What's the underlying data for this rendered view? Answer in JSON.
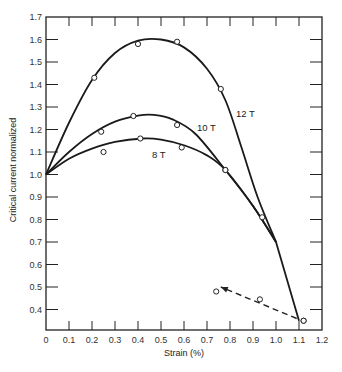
{
  "chart_data": {
    "type": "line",
    "title": "",
    "xlabel": "Strain (%)",
    "ylabel": "Critical current normalized",
    "xlim": [
      0,
      1.2
    ],
    "ylim": [
      0.31,
      1.7
    ],
    "x_ticks": [
      "0",
      "0.1",
      "0.2",
      "0.3",
      "0.4",
      "0.5",
      "0.6",
      "0.7",
      "0.8",
      "0.9",
      "1.0",
      "1.1",
      "1.2"
    ],
    "y_ticks": [
      "0.4",
      "0.5",
      "0.6",
      "0.7",
      "0.8",
      "0.9",
      "1.0",
      "1.1",
      "1.2",
      "1.3",
      "1.4",
      "1.5",
      "1.6",
      "1.7"
    ],
    "grid": false,
    "legend": "inline curve labels",
    "series": [
      {
        "name": "12 T",
        "points": [
          [
            0,
            1.0
          ],
          [
            0.21,
            1.43
          ],
          [
            0.4,
            1.58
          ],
          [
            0.57,
            1.59
          ],
          [
            0.76,
            1.38
          ],
          [
            0.94,
            0.81
          ],
          [
            1.12,
            0.35
          ]
        ],
        "curve": [
          [
            0,
            1.0
          ],
          [
            0.1,
            1.23
          ],
          [
            0.2,
            1.42
          ],
          [
            0.3,
            1.54
          ],
          [
            0.4,
            1.595
          ],
          [
            0.5,
            1.6
          ],
          [
            0.6,
            1.565
          ],
          [
            0.7,
            1.47
          ],
          [
            0.78,
            1.33
          ],
          [
            0.85,
            1.12
          ],
          [
            0.92,
            0.9
          ],
          [
            1.0,
            0.7
          ],
          [
            1.1,
            0.35
          ]
        ]
      },
      {
        "name": "10 T",
        "points": [
          [
            0,
            1.0
          ],
          [
            0.24,
            1.19
          ],
          [
            0.38,
            1.26
          ],
          [
            0.57,
            1.22
          ],
          [
            0.78,
            1.02
          ]
        ],
        "curve": [
          [
            0,
            1.0
          ],
          [
            0.1,
            1.1
          ],
          [
            0.2,
            1.18
          ],
          [
            0.3,
            1.235
          ],
          [
            0.4,
            1.262
          ],
          [
            0.47,
            1.265
          ],
          [
            0.55,
            1.245
          ],
          [
            0.65,
            1.18
          ],
          [
            0.78,
            1.02
          ],
          [
            0.9,
            0.86
          ],
          [
            1.0,
            0.7
          ]
        ]
      },
      {
        "name": "8 T",
        "points": [
          [
            0,
            1.0
          ],
          [
            0.25,
            1.1
          ],
          [
            0.41,
            1.16
          ],
          [
            0.59,
            1.12
          ],
          [
            0.78,
            1.02
          ]
        ],
        "curve": [
          [
            0,
            1.0
          ],
          [
            0.1,
            1.07
          ],
          [
            0.2,
            1.115
          ],
          [
            0.3,
            1.145
          ],
          [
            0.42,
            1.16
          ],
          [
            0.5,
            1.155
          ],
          [
            0.6,
            1.13
          ],
          [
            0.7,
            1.085
          ],
          [
            0.78,
            1.02
          ],
          [
            0.9,
            0.86
          ],
          [
            1.0,
            0.7
          ]
        ]
      },
      {
        "name": "unloading (dashed)",
        "points": [
          [
            0.74,
            0.48
          ],
          [
            0.93,
            0.445
          ],
          [
            1.12,
            0.35
          ]
        ],
        "curve": [
          [
            1.09,
            0.36
          ],
          [
            0.76,
            0.5
          ]
        ],
        "style": "dashed-arrow"
      }
    ],
    "annotations": [
      {
        "text": "12 T",
        "x": 0.83,
        "y": 1.27
      },
      {
        "text": "10 T",
        "x": 0.66,
        "y": 1.21
      },
      {
        "text": "8 T",
        "x": 0.46,
        "y": 1.09
      }
    ]
  },
  "labels": {
    "xlabel": "Strain (%)",
    "ylabel": "Critical current normalized",
    "curve_12": "12 T",
    "curve_10": "10 T",
    "curve_8": "8 T"
  }
}
